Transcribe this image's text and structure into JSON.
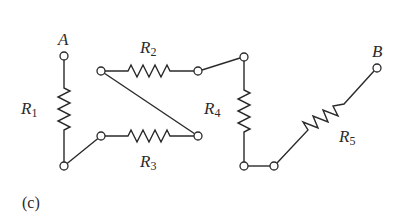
{
  "figure": {
    "caption": "(c)",
    "terminals": {
      "a": "A",
      "b": "B"
    },
    "resistors": [
      {
        "letter": "R",
        "sub": "1"
      },
      {
        "letter": "R",
        "sub": "2"
      },
      {
        "letter": "R",
        "sub": "3"
      },
      {
        "letter": "R",
        "sub": "4"
      },
      {
        "letter": "R",
        "sub": "5"
      }
    ]
  }
}
